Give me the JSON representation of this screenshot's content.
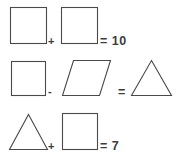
{
  "puzzle": {
    "title": "Shape equation puzzle",
    "stroke_color": "#4a4a4a",
    "text_color": "#3c3c3c",
    "background_color": "#ffffff",
    "rows": [
      {
        "id": "row-1",
        "shapes": [
          "square",
          "square"
        ],
        "operator": "+",
        "equals": "=",
        "result": "10",
        "result_label": "= 10"
      },
      {
        "id": "row-2",
        "shapes": [
          "square",
          "parallelogram",
          "triangle"
        ],
        "operator": "-",
        "equals": "=",
        "result": "",
        "result_label": "="
      },
      {
        "id": "row-3",
        "shapes": [
          "triangle",
          "square"
        ],
        "operator": "+",
        "equals": "=",
        "result": "7",
        "result_label": "= 7"
      }
    ]
  }
}
